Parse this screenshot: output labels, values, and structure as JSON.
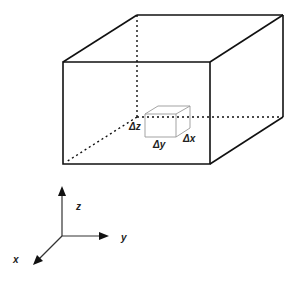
{
  "diagram": {
    "element_labels": {
      "dx": "Δx",
      "dy": "Δy",
      "dz": "Δz"
    },
    "axes": {
      "x": "x",
      "y": "y",
      "z": "z"
    },
    "colors": {
      "line": "#111111",
      "element": "#999999",
      "background": "#ffffff"
    }
  }
}
